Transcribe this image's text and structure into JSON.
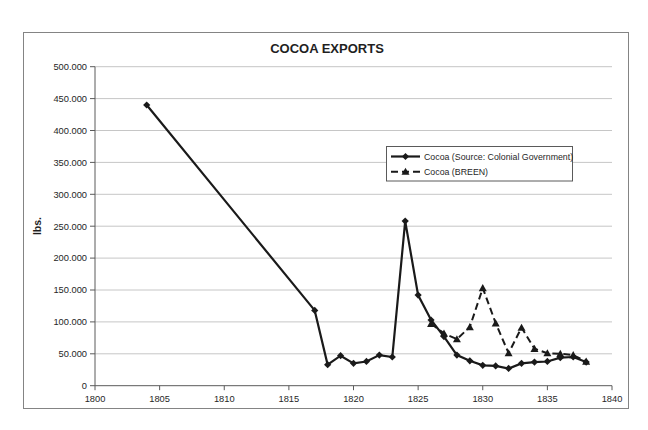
{
  "chart_data": {
    "type": "line",
    "title": "COCOA EXPORTS",
    "ylabel": "lbs.",
    "xlabel": "",
    "xlim": [
      1800,
      1840
    ],
    "ylim": [
      0,
      500000
    ],
    "x_tick_values": [
      1800,
      1805,
      1810,
      1815,
      1820,
      1825,
      1830,
      1835,
      1840
    ],
    "x_tick_labels": [
      "1800",
      "1805",
      "1810",
      "1815",
      "1820",
      "1825",
      "1830",
      "1835",
      "1840"
    ],
    "y_tick_values": [
      0,
      50000,
      100000,
      150000,
      200000,
      250000,
      300000,
      350000,
      400000,
      450000,
      500000
    ],
    "y_tick_labels": [
      "0",
      "50.000",
      "100.000",
      "150.000",
      "200.000",
      "250.000",
      "300.000",
      "350.000",
      "400.000",
      "450.000",
      "500.000"
    ],
    "grid": "horizontal gridlines on",
    "legend": {
      "position": "inside upper-right",
      "items": [
        {
          "label": "Cocoa (Source: Colonial Government)",
          "marker": "diamond",
          "line": "solid"
        },
        {
          "label": "Cocoa (BREEN)",
          "marker": "triangle",
          "line": "dashed"
        }
      ]
    },
    "series": [
      {
        "name": "Cocoa (Source: Colonial Government)",
        "marker": "diamond",
        "line_style": "solid",
        "color": "#1a1a1a",
        "points": [
          [
            1804,
            440000
          ],
          [
            1817,
            118000
          ],
          [
            1818,
            33000
          ],
          [
            1819,
            47000
          ],
          [
            1820,
            35000
          ],
          [
            1821,
            38000
          ],
          [
            1822,
            48000
          ],
          [
            1823,
            45000
          ],
          [
            1824,
            258000
          ],
          [
            1825,
            142000
          ],
          [
            1826,
            103000
          ],
          [
            1827,
            77000
          ],
          [
            1828,
            48000
          ],
          [
            1829,
            39000
          ],
          [
            1830,
            32000
          ],
          [
            1831,
            31000
          ],
          [
            1832,
            27000
          ],
          [
            1833,
            35000
          ],
          [
            1834,
            37000
          ],
          [
            1835,
            38000
          ],
          [
            1836,
            44000
          ],
          [
            1837,
            45000
          ],
          [
            1838,
            37000
          ]
        ]
      },
      {
        "name": "Cocoa (BREEN)",
        "marker": "triangle",
        "line_style": "dashed",
        "color": "#1a1a1a",
        "points": [
          [
            1826,
            97000
          ],
          [
            1827,
            82000
          ],
          [
            1828,
            73000
          ],
          [
            1829,
            92000
          ],
          [
            1830,
            153000
          ],
          [
            1831,
            98000
          ],
          [
            1832,
            51000
          ],
          [
            1833,
            91000
          ],
          [
            1834,
            58000
          ],
          [
            1835,
            51000
          ],
          [
            1836,
            50000
          ],
          [
            1837,
            48000
          ],
          [
            1838,
            38000
          ]
        ]
      }
    ],
    "colors": {
      "line": "#1a1a1a",
      "gridline": "#c6c6c6",
      "axis": "#5a5a5a",
      "frame": "#848484",
      "text": "#262626",
      "background": "#ffffff"
    }
  }
}
